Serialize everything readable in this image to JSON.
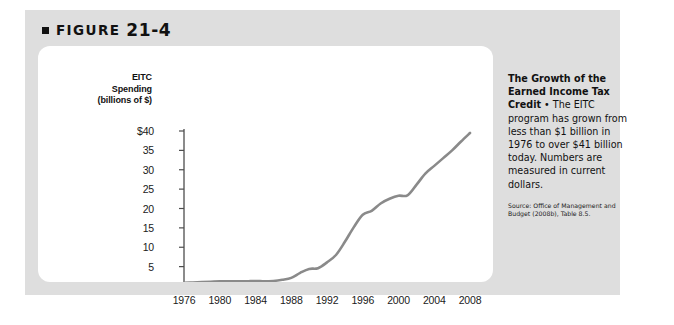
{
  "figure": {
    "label": "FIGURE",
    "number": "21-4",
    "bullet_icon": "square-bullet-icon"
  },
  "caption": {
    "title": "The Growth of the Earned Income Tax Credit",
    "separator": " • ",
    "body": "The EITC program has grown from less than $1 billion in 1976 to over $41 billion today. Numbers are measured in current dollars.",
    "source": "Source: Office of Management and Budget (2008b), Table 8.5."
  },
  "colors": {
    "panel_background": "#dedede",
    "card_background": "#ffffff",
    "line": "#8a8a8a",
    "axis": "#4d4d4d",
    "text": "#111111"
  },
  "chart_data": {
    "type": "line",
    "title": "",
    "xlabel": "",
    "ylabel": "EITC Spending (billions of $)",
    "ylabel_lines": [
      "EITC",
      "Spending",
      "(billions of $)"
    ],
    "xlim": [
      1976,
      2008
    ],
    "ylim": [
      0,
      41
    ],
    "grid": false,
    "legend": "none",
    "y_ticks": [
      5,
      10,
      15,
      20,
      25,
      30,
      35,
      40
    ],
    "y_tick_labels": [
      "5",
      "10",
      "15",
      "20",
      "25",
      "30",
      "35",
      "$40"
    ],
    "x_ticks": [
      1976,
      1980,
      1984,
      1988,
      1992,
      1996,
      2000,
      2004,
      2008
    ],
    "x_tick_labels": [
      "1976",
      "1980",
      "1984",
      "1988",
      "1992",
      "1996",
      "2000",
      "2004",
      "2008"
    ],
    "series": [
      {
        "name": "EITC Spending",
        "x": [
          1976,
          1977,
          1978,
          1979,
          1980,
          1981,
          1982,
          1983,
          1984,
          1985,
          1986,
          1987,
          1988,
          1989,
          1990,
          1991,
          1992,
          1993,
          1994,
          1995,
          1996,
          1997,
          1998,
          1999,
          2000,
          2001,
          2002,
          2003,
          2004,
          2005,
          2006,
          2007,
          2008
        ],
        "values": [
          0.8,
          0.9,
          1.0,
          1.1,
          1.2,
          1.2,
          1.2,
          1.2,
          1.3,
          1.2,
          1.3,
          1.6,
          2.1,
          3.4,
          4.4,
          4.6,
          6.1,
          8.0,
          11.4,
          15.2,
          18.4,
          19.4,
          21.3,
          22.5,
          23.3,
          23.4,
          26.1,
          29.0,
          31.0,
          33.0,
          35.0,
          37.3,
          39.5
        ]
      }
    ],
    "annotation_values": {
      "first_year": 1976,
      "first_value_text": "less than $1 billion",
      "latest_value_text": "over $41 billion"
    }
  }
}
